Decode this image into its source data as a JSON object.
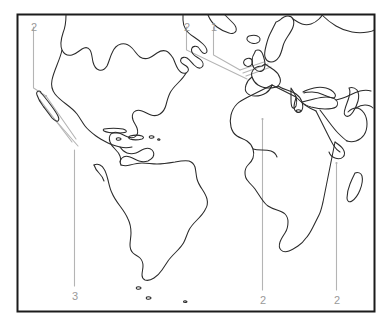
{
  "figure": {
    "kind": "world-map-outline-with-numbered-leader-lines",
    "frame_color": "#1b1b1b",
    "coastline_color": "#2a2a2a",
    "leader_line_color": "#b4b4b4",
    "label_color": "#9a9a9a",
    "background": "#ffffff"
  },
  "labels": [
    {
      "id": "label-top-left",
      "text": "2",
      "x": 31,
      "y": 22
    },
    {
      "id": "label-top-center-2",
      "text": "2",
      "x": 184,
      "y": 22
    },
    {
      "id": "label-top-center-1",
      "text": "1",
      "x": 211,
      "y": 22
    },
    {
      "id": "label-bottom-left",
      "text": "3",
      "x": 72,
      "y": 291
    },
    {
      "id": "label-bottom-africa",
      "text": "2",
      "x": 260,
      "y": 295
    },
    {
      "id": "label-bottom-right",
      "text": "2",
      "x": 334,
      "y": 295
    }
  ],
  "regions": [
    "North America",
    "Central America",
    "Caribbean",
    "South America",
    "Greenland",
    "Europe",
    "British Isles",
    "Scandinavia",
    "Africa",
    "Madagascar",
    "Arabian Peninsula",
    "Asia Minor"
  ]
}
